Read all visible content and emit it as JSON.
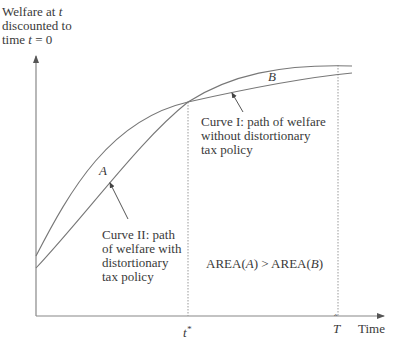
{
  "y_axis": {
    "label_line1": "Welfare at ",
    "label_line1_var": "t",
    "label_line2": "discounted to",
    "label_line3_pre": "time ",
    "label_line3_var": "t",
    "label_line3_post": " = 0"
  },
  "x_axis": {
    "label": "Time",
    "tick_tstar": "t",
    "tick_tstar_sup": "*",
    "tick_that": "T"
  },
  "regions": {
    "a": "A",
    "b": "B"
  },
  "curve_1": {
    "line1": "Curve I: path of welfare",
    "line2": "without distortionary",
    "line3": "tax policy"
  },
  "curve_2": {
    "line1": "Curve II: path",
    "line2": "of welfare with",
    "line3": "distortionary",
    "line4": "tax policy"
  },
  "area_comparison": {
    "pre": "AREA(",
    "a": "A",
    "mid": ") > AREA(",
    "b": "B",
    "post": ")"
  },
  "colors": {
    "line": "#777777",
    "text": "#3a3a3a",
    "dotted": "#999999"
  }
}
